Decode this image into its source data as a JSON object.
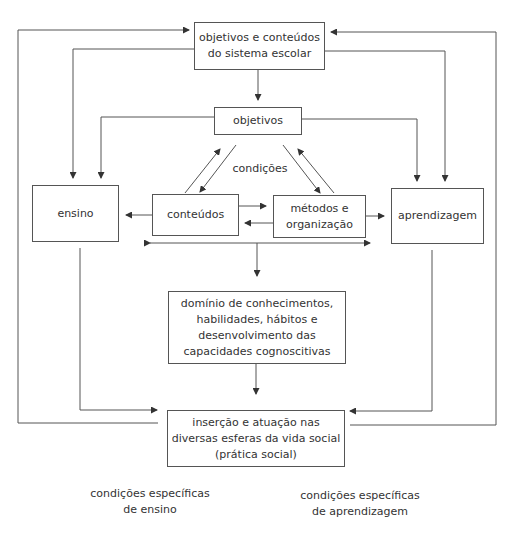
{
  "diagram": {
    "boxes": {
      "sistema": {
        "lines": [
          "objetivos e conteúdos",
          "do sistema escolar"
        ]
      },
      "objetivos": {
        "lines": [
          "objetivos"
        ]
      },
      "ensino": {
        "lines": [
          "ensino"
        ]
      },
      "conteudos": {
        "lines": [
          "conteúdos"
        ]
      },
      "metodos": {
        "lines": [
          "métodos e",
          "organização"
        ]
      },
      "aprendizagem": {
        "lines": [
          "aprendizagem"
        ]
      },
      "dominio": {
        "lines": [
          "domínio de conhecimentos,",
          "habilidades, hábitos e",
          "desenvolvimento das",
          "capacidades cognoscitivas"
        ]
      },
      "insercao": {
        "lines": [
          "inserção e atuação nas",
          "diversas esferas da vida social",
          "(prática social)"
        ]
      }
    },
    "labels": {
      "condicoes": "condições",
      "cond_ensino": [
        "condições específicas",
        "de ensino"
      ],
      "cond_aprendizagem": [
        "condições específicas",
        "de aprendizagem"
      ]
    },
    "colors": {
      "line": "#444444",
      "text": "#333333"
    }
  }
}
